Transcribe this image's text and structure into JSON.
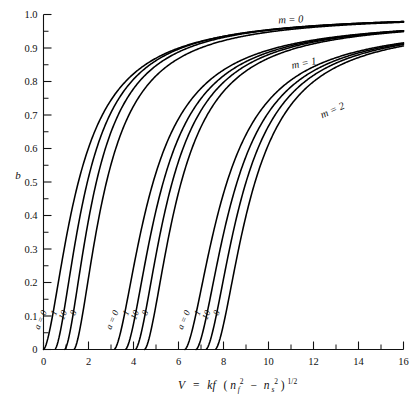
{
  "figure": {
    "name": "waveguide-mode-dispersion-chart",
    "background": "#ffffff",
    "ink": "#000000"
  },
  "chart_data": {
    "type": "line",
    "title": "",
    "subtitle": "",
    "xlabel": "V = kf (n_f^2 - n_s^2)^(1/2)",
    "ylabel": "b",
    "xlim": [
      0,
      16
    ],
    "ylim": [
      0,
      1.0
    ],
    "grid": false,
    "legend_position": "inline-annotations",
    "xticks": [
      0,
      2,
      4,
      6,
      8,
      10,
      12,
      14,
      16
    ],
    "xticklabels": [
      "0",
      "2",
      "4",
      "6",
      "8",
      "10",
      "12",
      "14",
      "16"
    ],
    "x_minor_tick_step": 1,
    "yticks": [
      0,
      0.1,
      0.2,
      0.3,
      0.4,
      0.5,
      0.6,
      0.7,
      0.8,
      0.9,
      1.0
    ],
    "yticklabels": [
      "0",
      "0.1",
      "0.2",
      "0.3",
      "0.4",
      "0.5",
      "0.6",
      "0.7",
      "0.8",
      "0.9",
      "1.0"
    ],
    "y_minor_tick_step": 0.05,
    "mode_groups": [
      {
        "m": 0,
        "label": "m = 0",
        "label_x": 11.0,
        "label_y": 0.975,
        "curves": [
          {
            "a": "0",
            "a_label": "a = 0",
            "V_cutoff": 0.0,
            "Vhalf": 1.55
          },
          {
            "a": "1",
            "a_label": "1",
            "V_cutoff": 0.5,
            "Vhalf": 1.95
          },
          {
            "a": "10",
            "a_label": "10",
            "V_cutoff": 0.94,
            "Vhalf": 2.35
          },
          {
            "a": "inf",
            "a_label": "8",
            "V_cutoff": 1.35,
            "Vhalf": 2.8
          }
        ]
      },
      {
        "m": 1,
        "label": "m = 1",
        "label_x": 11.6,
        "label_y": 0.845,
        "curves": [
          {
            "a": "0",
            "a_label": "a = 0",
            "V_cutoff": 3.14,
            "Vhalf": 4.85
          },
          {
            "a": "1",
            "a_label": "1",
            "V_cutoff": 3.64,
            "Vhalf": 5.3
          },
          {
            "a": "10",
            "a_label": "10",
            "V_cutoff": 4.08,
            "Vhalf": 5.7
          },
          {
            "a": "inf",
            "a_label": "8",
            "V_cutoff": 4.49,
            "Vhalf": 6.1
          }
        ]
      },
      {
        "m": 2,
        "label": "m = 2",
        "label_x": 12.9,
        "label_y": 0.705,
        "curves": [
          {
            "a": "0",
            "a_label": "a = 0",
            "V_cutoff": 6.28,
            "Vhalf": 8.1
          },
          {
            "a": "1",
            "a_label": "1",
            "V_cutoff": 6.78,
            "Vhalf": 8.55
          },
          {
            "a": "10",
            "a_label": "10",
            "V_cutoff": 7.22,
            "Vhalf": 8.95
          },
          {
            "a": "inf",
            "a_label": "8",
            "V_cutoff": 7.63,
            "Vhalf": 9.35
          }
        ]
      }
    ],
    "curve_label_text": {
      "a0": "a = 0",
      "a1": "1",
      "a10": "10",
      "ainf": "8"
    },
    "xtitle_parts": {
      "v": "V",
      "eq": "=",
      "kf": "kf",
      "open": "(",
      "n1": "n",
      "sub1": "f",
      "sup1": "2",
      "minus": "−",
      "n2": "n",
      "sub2": "s",
      "sup2": "2",
      "close": ")",
      "exp": "1/2"
    }
  }
}
